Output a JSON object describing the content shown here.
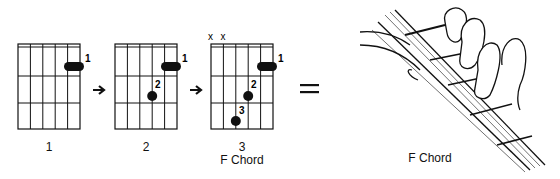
{
  "diagrams": [
    {
      "step_label": "1",
      "chord_label": "",
      "muted": [],
      "fingers": [
        {
          "num": "1",
          "type": "barre"
        }
      ]
    },
    {
      "step_label": "2",
      "chord_label": "",
      "muted": [],
      "fingers": [
        {
          "num": "1",
          "type": "barre"
        },
        {
          "num": "2",
          "type": "dot"
        }
      ]
    },
    {
      "step_label": "3",
      "chord_label": "F Chord",
      "muted": [
        "x",
        "x"
      ],
      "fingers": [
        {
          "num": "1",
          "type": "barre"
        },
        {
          "num": "2",
          "type": "dot"
        },
        {
          "num": "3",
          "type": "dot"
        }
      ]
    }
  ],
  "illustration": {
    "caption": "F Chord"
  },
  "symbols": {
    "arrow": "→",
    "equals": "="
  }
}
